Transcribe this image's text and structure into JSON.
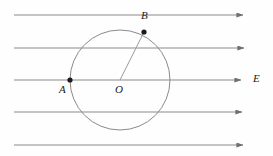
{
  "figure": {
    "type": "physics-diagram",
    "canvas": {
      "width": 273,
      "height": 156,
      "background": "#fefefe"
    },
    "colors": {
      "field_line": "#8a8a8a",
      "circle": "#8a8a8a",
      "radius_line": "#9a9a9a",
      "point_dot": "#1a1a1a",
      "label_text": "#1a1a1a"
    },
    "field_lines": [
      {
        "name": "field-line-1",
        "y": 15,
        "x_start": 14,
        "x_end": 249
      },
      {
        "name": "field-line-2",
        "y": 48,
        "x_start": 14,
        "x_end": 250
      },
      {
        "name": "field-line-3",
        "y": 80,
        "x_start": 14,
        "x_end": 247
      },
      {
        "name": "field-line-4",
        "y": 112,
        "x_start": 14,
        "x_end": 248
      },
      {
        "name": "field-line-5",
        "y": 145,
        "x_start": 14,
        "x_end": 249
      }
    ],
    "circle": {
      "cx": 120,
      "cy": 80,
      "r": 50
    },
    "radius_segment": {
      "from": "O",
      "to": "B",
      "x1": 120,
      "y1": 80,
      "x2": 144,
      "y2": 32
    },
    "points": [
      {
        "id": "A",
        "label": "A",
        "x": 70,
        "y": 80,
        "label_x": 60,
        "label_y": 85
      },
      {
        "id": "B",
        "label": "B",
        "x": 144,
        "y": 32,
        "label_x": 144,
        "label_y": 11
      },
      {
        "id": "O",
        "label": "O",
        "x": 120,
        "y": 80,
        "label_x": 115,
        "label_y": 84
      }
    ],
    "annotations": [
      {
        "id": "E",
        "label": "E",
        "meaning": "electric-field-label",
        "x": 254,
        "y": 74
      }
    ]
  }
}
